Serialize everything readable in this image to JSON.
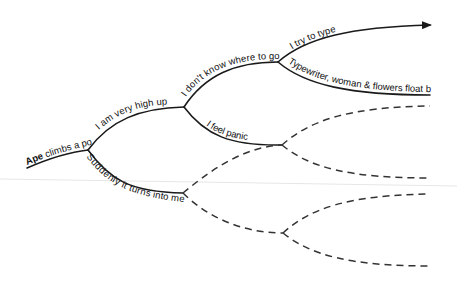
{
  "diagram": {
    "type": "branching-timeline",
    "root": {
      "label_bold": "Ape",
      "label_rest": " climbs a pole"
    },
    "nodes": {
      "high_up": "I am very high up",
      "turns_into_me": "Suddenly it turns into me",
      "dont_know": "I don't know where to go",
      "feel_panic": "I feel panic",
      "try_to_type": "I try to type",
      "typewriter": "Typewriter, woman & flowers float by"
    },
    "dashed_branches": 5,
    "arrow": "arrow-right",
    "colors": {
      "line": "#1a1a1a",
      "dashed": "#333333",
      "background": "#ffffff"
    }
  }
}
